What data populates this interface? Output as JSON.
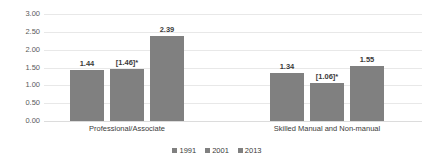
{
  "chart_data": {
    "type": "bar",
    "title": "",
    "subtitle": "",
    "xlabel": "",
    "ylabel": "",
    "ylim": [
      0,
      3.0
    ],
    "ytick_step": 0.5,
    "ytick_labels": [
      "3.00",
      "2.50",
      "2.00",
      "1.50",
      "1.00",
      "0.50",
      "0.00"
    ],
    "ytick_values": [
      3.0,
      2.5,
      2.0,
      1.5,
      1.0,
      0.5,
      0.0
    ],
    "grid": true,
    "grid_axis": "y",
    "legend_position": "bottom",
    "categories": [
      "Professional/Associate",
      "Skilled Manual and Non-manual"
    ],
    "series": [
      {
        "name": "1991",
        "color": "#808080",
        "values": [
          1.44,
          1.34
        ],
        "labels": [
          "1.44",
          "1.34"
        ]
      },
      {
        "name": "2001",
        "color": "#808080",
        "values": [
          1.46,
          1.06
        ],
        "labels": [
          "[1.46]*",
          "[1.06]*"
        ]
      },
      {
        "name": "2013",
        "color": "#808080",
        "values": [
          2.39,
          1.55
        ],
        "labels": [
          "2.39",
          "1.55"
        ]
      }
    ],
    "bar_color": "#808080",
    "gridline_color": "#e8e8e8",
    "background_color": "#ffffff"
  },
  "legend": {
    "items": [
      {
        "label": "1991",
        "color": "#808080"
      },
      {
        "label": "2001",
        "color": "#808080"
      },
      {
        "label": "2013",
        "color": "#808080"
      }
    ]
  }
}
